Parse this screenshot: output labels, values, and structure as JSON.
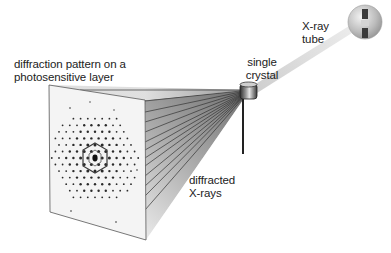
{
  "diagram": {
    "type": "x-ray crystallography setup",
    "labels": {
      "screen": [
        "diffraction pattern on a",
        "photosensitive layer"
      ],
      "crystal": [
        "single",
        "crystal"
      ],
      "tube": [
        "X-ray",
        "tube"
      ],
      "rays": [
        "diffracted",
        "X-rays"
      ]
    },
    "components": [
      {
        "id": "xray-tube",
        "name": "X-ray tube"
      },
      {
        "id": "incident-beam",
        "name": "incident X-ray beam"
      },
      {
        "id": "crystal",
        "name": "single crystal"
      },
      {
        "id": "crystal-holder",
        "name": "crystal mount rod"
      },
      {
        "id": "diffracted-rays",
        "name": "diffracted X-rays"
      },
      {
        "id": "detector",
        "name": "photosensitive layer with diffraction pattern"
      }
    ],
    "colors": {
      "background": "#ffffff",
      "text": "#222222",
      "ray_line": "#333333",
      "cone_dark": "#7a7a7a",
      "cone_light": "#f4f4f4",
      "tube_fill": "#b8b8b8",
      "spot": "#2a2a2a"
    }
  }
}
